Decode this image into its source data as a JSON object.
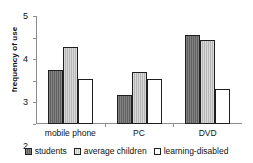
{
  "chart_data": {
    "type": "bar",
    "title": "",
    "xlabel": "",
    "ylabel": "frequency of use",
    "categories": [
      "mobile phone",
      "PC",
      "DVD"
    ],
    "series": [
      {
        "name": "students",
        "swatch": "dark-grey-hatched",
        "color": "#6b6b6b",
        "values": [
          2.5,
          1.35,
          4.1
        ]
      },
      {
        "name": "average children",
        "swatch": "light-grey-hatched",
        "color": "#c4c4c4",
        "values": [
          3.55,
          2.4,
          3.9
        ]
      },
      {
        "name": "learning-disabled",
        "swatch": "white",
        "color": "#ffffff",
        "values": [
          2.1,
          2.1,
          1.6
        ]
      }
    ],
    "ylim": [
      0,
      5
    ],
    "ytick_labels": [
      "5",
      "4",
      "3",
      "2",
      "1",
      "0"
    ],
    "ytick_values": [
      5,
      4,
      3,
      2,
      1,
      0
    ],
    "grid": false,
    "legend_position": "bottom-center",
    "axis_color": "#8d8d8d",
    "bar_edge_color": "#1f1f1f"
  }
}
